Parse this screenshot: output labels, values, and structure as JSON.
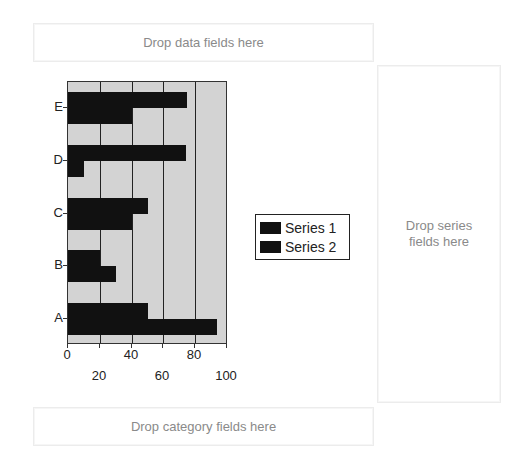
{
  "dropzones": {
    "data": "Drop data fields here",
    "series_line1": "Drop series",
    "series_line2": "fields here",
    "category": "Drop category fields here"
  },
  "legend": {
    "items": [
      {
        "label": "Series 1",
        "color": "#111111"
      },
      {
        "label": "Series 2",
        "color": "#111111"
      }
    ]
  },
  "axis": {
    "x_ticks_upper": [
      "0",
      "40",
      "80"
    ],
    "x_ticks_lower": [
      "20",
      "60",
      "100"
    ],
    "y_labels": [
      "E",
      "D",
      "C",
      "B",
      "A"
    ]
  },
  "chart_data": {
    "type": "bar",
    "orientation": "horizontal",
    "title": "",
    "xlabel": "",
    "ylabel": "",
    "categories": [
      "A",
      "B",
      "C",
      "D",
      "E"
    ],
    "series": [
      {
        "name": "Series 1",
        "values": [
          50,
          20,
          50,
          74,
          75
        ]
      },
      {
        "name": "Series 2",
        "values": [
          94,
          30,
          40,
          10,
          40
        ]
      }
    ],
    "x_ticks": [
      0,
      20,
      40,
      60,
      80,
      100
    ],
    "xlim": [
      0,
      100
    ],
    "grid": true,
    "legend_position": "right",
    "plot_background": "#d3d3d3",
    "bar_color": "#111111"
  }
}
